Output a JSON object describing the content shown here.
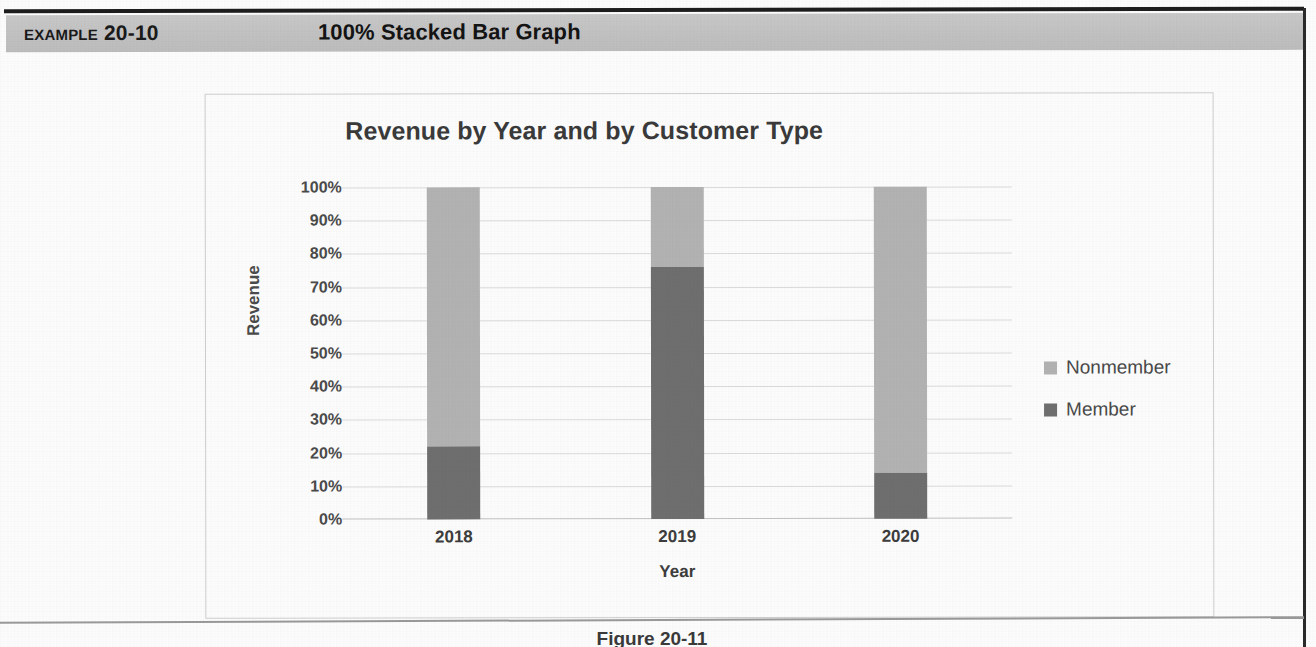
{
  "page": {
    "example_label": "Example 20-10",
    "example_title": "100% Stacked Bar Graph",
    "figure_caption": "Figure 20-11"
  },
  "legend": {
    "items": [
      {
        "label": "Nonmember",
        "color": "#b3b3b3",
        "swatch_icon": "legend-swatch-icon"
      },
      {
        "label": "Member",
        "color": "#6f6f6f",
        "swatch_icon": "legend-swatch-icon"
      }
    ]
  },
  "axes": {
    "y_title": "Revenue",
    "x_title": "Year",
    "y_ticks": [
      "100%",
      "90%",
      "80%",
      "70%",
      "60%",
      "50%",
      "40%",
      "30%",
      "20%",
      "10%",
      "0%"
    ],
    "x_ticks": [
      "2018",
      "2019",
      "2020"
    ]
  },
  "chart_data": {
    "type": "bar",
    "subtype": "100% stacked bar",
    "title": "Revenue by Year and by Customer Type",
    "xlabel": "Year",
    "ylabel": "Revenue",
    "categories": [
      "2018",
      "2019",
      "2020"
    ],
    "series": [
      {
        "name": "Member",
        "values": [
          22,
          76,
          14
        ],
        "color": "#6f6f6f"
      },
      {
        "name": "Nonmember",
        "values": [
          78,
          24,
          86
        ],
        "color": "#b3b3b3"
      }
    ],
    "stack_order_bottom_to_top": [
      "Member",
      "Nonmember"
    ],
    "ylim": [
      0,
      100
    ],
    "y_tick_step": 10,
    "y_tick_format": "percent",
    "grid": true,
    "legend_position": "right",
    "annotations": []
  },
  "colors": {
    "member": "#6f6f6f",
    "nonmember": "#b3b3b3",
    "gridline": "#dcdcdc",
    "header_band": "#c4c4c4",
    "title_text": "#3a3a3a"
  }
}
